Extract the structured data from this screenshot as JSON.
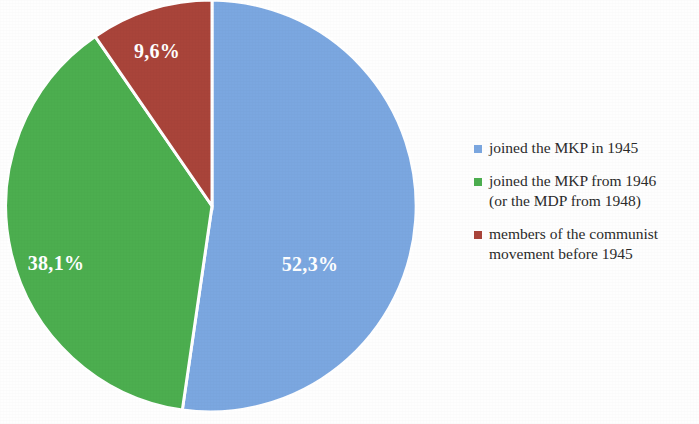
{
  "chart_data": {
    "type": "pie",
    "title": "",
    "subtitle": "",
    "xlabel": "",
    "ylabel": "",
    "grid": false,
    "legend_position": "right",
    "categories": [
      "joined the MKP in 1945",
      "joined the MKP from 1946 (or the MDP from 1948)",
      "members of the communist movement before 1945"
    ],
    "values": [
      52.3,
      38.1,
      9.6
    ],
    "value_labels": [
      "52,3%",
      "38,1%",
      "9,6%"
    ],
    "colors": [
      "#7ba7e0",
      "#4cae4f",
      "#a9443a"
    ],
    "slices": [
      {
        "label": "joined the MKP in 1945",
        "value": 52.3,
        "value_label": "52,3%",
        "color": "#7ba7e0",
        "legend_text": "joined the MKP in 1945"
      },
      {
        "label": "joined the MKP from 1946 (or the MDP from 1948)",
        "value": 38.1,
        "value_label": "38,1%",
        "color": "#4cae4f",
        "legend_text": "joined the MKP from 1946\n(or the MDP from 1948)"
      },
      {
        "label": "members of the communist movement before 1945",
        "value": 9.6,
        "value_label": "9,6%",
        "color": "#a9443a",
        "legend_text": "members of the communist\nmovement before 1945"
      }
    ]
  },
  "legend": {
    "items": [
      {
        "marker": "legend-marker-blue",
        "color": "#7ba7e0",
        "text": "joined the MKP in 1945"
      },
      {
        "marker": "legend-marker-green",
        "color": "#4cae4f",
        "text": "joined the MKP from 1946\n(or the MDP from 1948)"
      },
      {
        "marker": "legend-marker-red",
        "color": "#a9443a",
        "text": "members of the communist\nmovement before 1945"
      }
    ]
  }
}
